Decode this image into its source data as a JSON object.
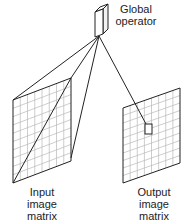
{
  "labels": {
    "operator": [
      "Global",
      "operator"
    ],
    "input": [
      "Input",
      "image",
      "matrix"
    ],
    "output": [
      "Output",
      "image",
      "matrix"
    ]
  },
  "colors": {
    "line": "#222222",
    "grid": "#b8b8b8",
    "background": "#ffffff"
  },
  "grid": {
    "rows": 10,
    "cols": 8
  }
}
